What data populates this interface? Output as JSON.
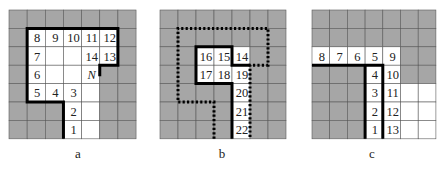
{
  "figure": {
    "colors": {
      "blocked": "#a6a6a6",
      "open": "#ffffff",
      "grid_line": "#5a5a5a",
      "path": "#000000"
    },
    "panels": [
      {
        "id": "a",
        "caption": "a",
        "origin": [
          9,
          10
        ],
        "cell": [
          18.15,
          18.4
        ],
        "cols": 7,
        "rows": 7,
        "open_cells": [
          [
            1,
            1
          ],
          [
            2,
            1
          ],
          [
            3,
            1
          ],
          [
            4,
            1
          ],
          [
            5,
            1
          ],
          [
            1,
            2
          ],
          [
            2,
            2
          ],
          [
            3,
            2
          ],
          [
            4,
            2
          ],
          [
            5,
            2
          ],
          [
            1,
            3
          ],
          [
            2,
            3
          ],
          [
            3,
            3
          ],
          [
            4,
            3
          ],
          [
            1,
            4
          ],
          [
            2,
            4
          ],
          [
            3,
            4
          ],
          [
            4,
            4
          ],
          [
            3,
            5
          ],
          [
            4,
            5
          ],
          [
            3,
            6
          ],
          [
            4,
            6
          ]
        ],
        "labels": [
          {
            "t": "8",
            "c": 1,
            "r": 1
          },
          {
            "t": "9",
            "c": 2,
            "r": 1
          },
          {
            "t": "10",
            "c": 3,
            "r": 1
          },
          {
            "t": "11",
            "c": 4,
            "r": 1
          },
          {
            "t": "12",
            "c": 5,
            "r": 1
          },
          {
            "t": "7",
            "c": 1,
            "r": 2
          },
          {
            "t": "14",
            "c": 4,
            "r": 2
          },
          {
            "t": "13",
            "c": 5,
            "r": 2
          },
          {
            "t": "6",
            "c": 1,
            "r": 3
          },
          {
            "t": "N",
            "c": 4,
            "r": 3,
            "italic": true
          },
          {
            "t": "5",
            "c": 1,
            "r": 4
          },
          {
            "t": "4",
            "c": 2,
            "r": 4
          },
          {
            "t": "3",
            "c": 3,
            "r": 4
          },
          {
            "t": "2",
            "c": 3,
            "r": 5
          },
          {
            "t": "1",
            "c": 3,
            "r": 6
          }
        ],
        "solid_path": [
          [
            3,
            7
          ],
          [
            3,
            5
          ],
          [
            1,
            5
          ],
          [
            1,
            1
          ],
          [
            6,
            1
          ],
          [
            6,
            3
          ],
          [
            5,
            3
          ],
          [
            5,
            3.6
          ]
        ],
        "dotted_path": []
      },
      {
        "id": "b",
        "caption": "b",
        "origin": [
          160,
          10
        ],
        "cell": [
          18.0,
          18.4
        ],
        "cols": 7,
        "rows": 7,
        "open_cells": [
          [
            2,
            2
          ],
          [
            3,
            2
          ],
          [
            4,
            2
          ],
          [
            2,
            3
          ],
          [
            3,
            3
          ],
          [
            4,
            3
          ],
          [
            4,
            4
          ],
          [
            4,
            5
          ],
          [
            4,
            6
          ]
        ],
        "labels": [
          {
            "t": "16",
            "c": 2,
            "r": 2
          },
          {
            "t": "15",
            "c": 3,
            "r": 2
          },
          {
            "t": "14",
            "c": 4,
            "r": 2
          },
          {
            "t": "17",
            "c": 2,
            "r": 3
          },
          {
            "t": "18",
            "c": 3,
            "r": 3
          },
          {
            "t": "19",
            "c": 4,
            "r": 3
          },
          {
            "t": "20",
            "c": 4,
            "r": 4
          },
          {
            "t": "21",
            "c": 4,
            "r": 5
          },
          {
            "t": "22",
            "c": 4,
            "r": 6
          }
        ],
        "solid_path": [
          [
            4,
            7
          ],
          [
            4,
            4
          ],
          [
            2,
            4
          ],
          [
            2,
            2
          ],
          [
            4,
            2
          ],
          [
            4,
            3
          ],
          [
            5,
            3
          ]
        ],
        "dotted_path": [
          [
            3,
            7
          ],
          [
            3,
            5
          ],
          [
            1,
            5
          ],
          [
            1,
            1
          ],
          [
            6,
            1
          ],
          [
            6,
            3
          ],
          [
            5,
            3
          ],
          [
            5,
            7
          ]
        ]
      },
      {
        "id": "c",
        "caption": "c",
        "origin": [
          312,
          10
        ],
        "cell": [
          17.7,
          18.4
        ],
        "cols": 7,
        "rows": 7,
        "open_cells": [
          [
            0,
            2
          ],
          [
            1,
            2
          ],
          [
            2,
            2
          ],
          [
            3,
            2
          ],
          [
            4,
            2
          ],
          [
            3,
            3
          ],
          [
            4,
            3
          ],
          [
            3,
            4
          ],
          [
            4,
            4
          ],
          [
            5,
            4
          ],
          [
            6,
            4
          ],
          [
            3,
            5
          ],
          [
            4,
            5
          ],
          [
            5,
            5
          ],
          [
            6,
            5
          ],
          [
            3,
            6
          ],
          [
            4,
            6
          ],
          [
            5,
            6
          ],
          [
            6,
            6
          ]
        ],
        "labels": [
          {
            "t": "8",
            "c": 0,
            "r": 2
          },
          {
            "t": "7",
            "c": 1,
            "r": 2
          },
          {
            "t": "6",
            "c": 2,
            "r": 2
          },
          {
            "t": "5",
            "c": 3,
            "r": 2
          },
          {
            "t": "9",
            "c": 4,
            "r": 2
          },
          {
            "t": "4",
            "c": 3,
            "r": 3
          },
          {
            "t": "10",
            "c": 4,
            "r": 3
          },
          {
            "t": "3",
            "c": 3,
            "r": 4
          },
          {
            "t": "11",
            "c": 4,
            "r": 4
          },
          {
            "t": "2",
            "c": 3,
            "r": 5
          },
          {
            "t": "12",
            "c": 4,
            "r": 5
          },
          {
            "t": "1",
            "c": 3,
            "r": 6
          },
          {
            "t": "13",
            "c": 4,
            "r": 6
          }
        ],
        "solid_path": [
          [
            0,
            3
          ],
          [
            4,
            3
          ],
          [
            4,
            7
          ]
        ],
        "solid_path_2": [
          [
            3,
            7
          ],
          [
            3,
            3
          ]
        ],
        "dotted_path": []
      }
    ]
  }
}
